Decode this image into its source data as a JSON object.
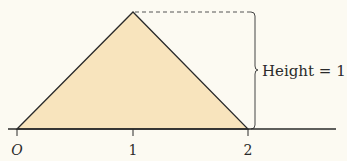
{
  "diagram": {
    "colors": {
      "background": "#fcfaf2",
      "triangle_fill": "#f8e4bd",
      "stroke": "#2a2a2a",
      "dash": "#555555"
    },
    "axis": {
      "ticks": [
        {
          "label": "O",
          "value": 0
        },
        {
          "label": "1",
          "value": 1
        },
        {
          "label": "2",
          "value": 2
        }
      ]
    },
    "triangle": {
      "vertices": [
        [
          0,
          0
        ],
        [
          1,
          1
        ],
        [
          2,
          0
        ]
      ]
    },
    "annotation": {
      "label": "Height = 1"
    }
  }
}
